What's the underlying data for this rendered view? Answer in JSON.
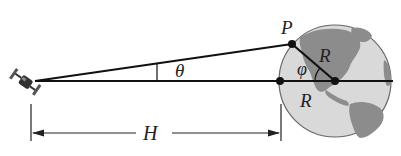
{
  "diagram": {
    "type": "geometry",
    "labels": {
      "theta": "θ",
      "phi": "φ",
      "P": "P",
      "R_upper": "R",
      "R_lower": "R",
      "H": "H"
    },
    "colors": {
      "line": "#111111",
      "earth_ocean": "#d6d6d6",
      "earth_land": "#8a8a8a",
      "earth_outline": "#555555"
    },
    "elements": [
      "satellite-icon",
      "earth-globe",
      "line-of-sight-to-P",
      "horizontal-line-to-center",
      "radius-to-P",
      "dimension-H"
    ]
  }
}
